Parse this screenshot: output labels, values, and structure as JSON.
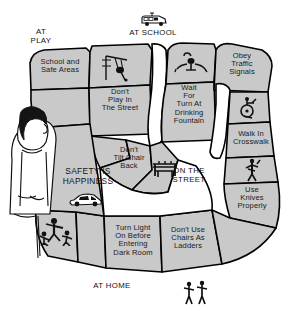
{
  "poster": {
    "motto": "SAFETY IS\nHAPPINESS",
    "motto_line1": "SAFETY IS",
    "motto_line2": "HAPPINESS",
    "background_color": "#ffffff",
    "cell_fill_color": "#c9c9c9",
    "outline_color": "#000000"
  },
  "zones": [
    {
      "id": "at-play",
      "label": "AT\nPLAY",
      "line1": "AT",
      "line2": "PLAY",
      "icon": "none"
    },
    {
      "id": "at-school",
      "label": "AT SCHOOL",
      "line1": "AT SCHOOL",
      "line2": "",
      "icon": "school-bus-icon"
    },
    {
      "id": "on-the-street",
      "label": "ON THE\nSTREET",
      "line1": "ON THE",
      "line2": "STREET",
      "icon": "none"
    },
    {
      "id": "at-home",
      "label": "AT HOME",
      "line1": "AT HOME",
      "line2": "",
      "icon": "none"
    }
  ],
  "cells": [
    {
      "id": "school-and-safe-areas",
      "text": "School and\nSafe Areas",
      "line1": "School and",
      "line2": "Safe Areas",
      "line3": "",
      "line4": "",
      "line5": ""
    },
    {
      "id": "dont-play-in-the-street",
      "text": "Don't\nPlay In\nThe Street",
      "line1": "Don't",
      "line2": "Play In",
      "line3": "The Street",
      "line4": "",
      "line5": ""
    },
    {
      "id": "wait-for-turn-at-drinking-fountain",
      "text": "Wait\nFor\nTurn At\nDrinking\nFountain",
      "line1": "Wait",
      "line2": "For",
      "line3": "Turn At",
      "line4": "Drinking",
      "line5": "Fountain"
    },
    {
      "id": "obey-traffic-signals",
      "text": "Obey\nTraffic\nSignals",
      "line1": "Obey",
      "line2": "Traffic",
      "line3": "Signals",
      "line4": "",
      "line5": ""
    },
    {
      "id": "walk-in-crosswalk",
      "text": "Walk In\nCrosswalk",
      "line1": "Walk In",
      "line2": "Crosswalk",
      "line3": "",
      "line4": "",
      "line5": ""
    },
    {
      "id": "dont-tilt-chair-back",
      "text": "Don't\nTilt Chair\nBack",
      "line1": "Don't",
      "line2": "Tilt Chair",
      "line3": "Back",
      "line4": "",
      "line5": ""
    },
    {
      "id": "use-knives-properly",
      "text": "Use\nKnives\nProperly",
      "line1": "Use",
      "line2": "Knives",
      "line3": "Properly",
      "line4": "",
      "line5": ""
    },
    {
      "id": "dont-use-chairs-as-ladders",
      "text": "Don't Use\nChairs As\nLadders",
      "line1": "Don't Use",
      "line2": "Chairs As",
      "line3": "Ladders",
      "line4": "",
      "line5": ""
    },
    {
      "id": "turn-light-on-before-entering-dark-room",
      "text": "Turn Light\nOn Before\nEntering\nDark Room",
      "line1": "Turn Light",
      "line2": "On Before",
      "line3": "Entering",
      "line4": "Dark Room",
      "line5": ""
    }
  ],
  "icons": [
    {
      "id": "school-bus-icon",
      "name": "school-bus-icon"
    },
    {
      "id": "swing-set-icon",
      "name": "swing-set-icon"
    },
    {
      "id": "drinking-fountain-icon",
      "name": "drinking-fountain-icon"
    },
    {
      "id": "wheelchair-icon",
      "name": "wheelchair-icon"
    },
    {
      "id": "chair-icon",
      "name": "chair-icon"
    },
    {
      "id": "knife-person-icon",
      "name": "knife-person-icon"
    },
    {
      "id": "car-icon",
      "name": "car-icon"
    },
    {
      "id": "children-playing-icon",
      "name": "children-playing-icon"
    },
    {
      "id": "two-children-icon",
      "name": "two-children-icon"
    },
    {
      "id": "boy-figure",
      "name": "boy-figure-illustration"
    }
  ]
}
